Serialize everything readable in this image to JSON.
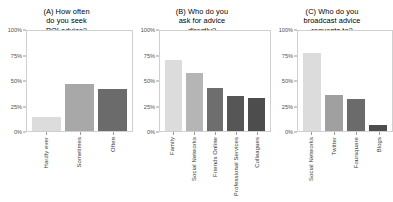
{
  "figure": {
    "background": "#ffffff",
    "axis_color": "#d0d0d0",
    "tick_color": "#9a9a9a",
    "text_color": "#000000"
  },
  "chart_data": [
    {
      "type": "bar",
      "title": "(A) How often do you seek POI advice?",
      "panel_label": "(A)",
      "categories": [
        "Hardly ever",
        "Sometimes",
        "Often"
      ],
      "values": [
        14,
        47,
        42
      ],
      "colors": [
        "#dcdcdc",
        "#a8a8a8",
        "#6b6b6b"
      ],
      "xlabel": "",
      "ylabel": "",
      "ylim": [
        0,
        100
      ],
      "yticks": [
        0,
        25,
        50,
        75,
        100
      ],
      "ytick_labels": [
        "0%",
        "25%",
        "50%",
        "75%",
        "100%"
      ],
      "grid": false,
      "legend": "none"
    },
    {
      "type": "bar",
      "title": "(B) Who do you ask for advice directly?",
      "panel_label": "(B)",
      "categories": [
        "Family",
        "Social Networks",
        "Friends Online",
        "Professional Services",
        "Colleagues"
      ],
      "values": [
        71,
        58,
        43,
        35,
        33
      ],
      "colors": [
        "#dcdcdc",
        "#b5b5b5",
        "#6e6e6e",
        "#565656",
        "#4d4d4d"
      ],
      "xlabel": "",
      "ylabel": "",
      "ylim": [
        0,
        100
      ],
      "yticks": [
        0,
        25,
        50,
        75,
        100
      ],
      "ytick_labels": [
        "0%",
        "25%",
        "50%",
        "75%",
        "100%"
      ],
      "grid": false,
      "legend": "none"
    },
    {
      "type": "bar",
      "title": "(C) Who do you broadcast advice requests to?",
      "panel_label": "(C)",
      "categories": [
        "Social Networks",
        "Twitter",
        "Foursquare",
        "Blogs"
      ],
      "values": [
        78,
        36,
        32,
        6
      ],
      "colors": [
        "#dcdcdc",
        "#a0a0a0",
        "#6b6b6b",
        "#4d4d4d"
      ],
      "xlabel": "",
      "ylabel": "",
      "ylim": [
        0,
        100
      ],
      "yticks": [
        0,
        25,
        50,
        75,
        100
      ],
      "ytick_labels": [
        "0%",
        "25%",
        "50%",
        "75%",
        "100%"
      ],
      "grid": false,
      "legend": "none"
    }
  ],
  "panels": {
    "a": {
      "title_line1": "(A) How often",
      "title_line2": "do you seek",
      "title_line3": "POI advice?"
    },
    "b": {
      "title_line1": "(B) Who do you",
      "title_line2": "ask for advice",
      "title_line3": "directly?"
    },
    "c": {
      "title_line1": "(C) Who do you",
      "title_line2": "broadcast advice",
      "title_line3": "requests to?"
    }
  }
}
